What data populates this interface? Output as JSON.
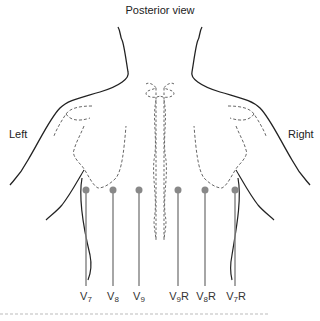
{
  "diagram": {
    "title": "Posterior view",
    "side_labels": {
      "left": "Left",
      "right": "Right"
    },
    "leads": [
      {
        "name": "V7",
        "base": "V",
        "sub": "7",
        "suffix": "",
        "x": 86
      },
      {
        "name": "V8",
        "base": "V",
        "sub": "8",
        "suffix": "",
        "x": 113
      },
      {
        "name": "V9",
        "base": "V",
        "sub": "9",
        "suffix": "",
        "x": 139
      },
      {
        "name": "V9R",
        "base": "V",
        "sub": "9",
        "suffix": "R",
        "x": 178
      },
      {
        "name": "V8R",
        "base": "V",
        "sub": "8",
        "suffix": "R",
        "x": 205
      },
      {
        "name": "V7R",
        "base": "V",
        "sub": "7",
        "suffix": "R",
        "x": 235
      }
    ],
    "colors": {
      "outline": "#222222",
      "dashed": "#555555",
      "lead": "#888888",
      "divider": "#aaaaaa"
    }
  }
}
